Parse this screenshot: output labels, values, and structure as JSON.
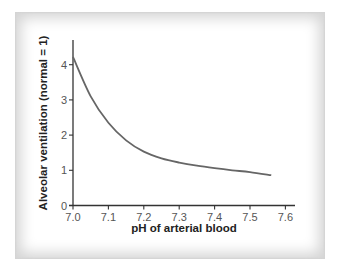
{
  "chart_data": {
    "type": "line",
    "title": "",
    "xlabel": "pH of arterial blood",
    "ylabel": "Alveolar ventilation (normal = 1)",
    "xlim": [
      7.0,
      7.6
    ],
    "ylim": [
      0,
      4.6
    ],
    "x_ticks": [
      "7.0",
      "7.1",
      "7.2",
      "7.3",
      "7.4",
      "7.5",
      "7.6"
    ],
    "y_ticks": [
      "0",
      "1",
      "2",
      "3",
      "4"
    ],
    "grid": false,
    "legend": null,
    "series": [
      {
        "name": "Alveolar ventilation",
        "color": "#666666",
        "x": [
          7.0,
          7.05,
          7.1,
          7.15,
          7.2,
          7.25,
          7.3,
          7.35,
          7.4,
          7.45,
          7.5,
          7.56
        ],
        "y": [
          4.22,
          3.1,
          2.35,
          1.85,
          1.53,
          1.34,
          1.22,
          1.13,
          1.06,
          1.0,
          0.95,
          0.86
        ]
      }
    ]
  }
}
